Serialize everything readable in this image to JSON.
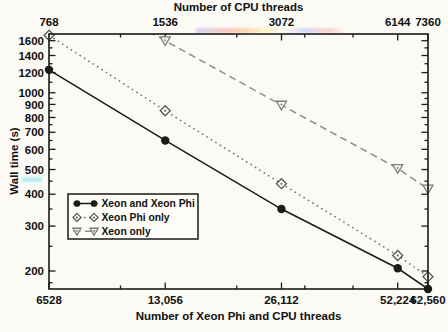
{
  "style": {
    "background": "#fcfaf4",
    "frame_color": "#1a1a1a",
    "text_color": "#111111",
    "legend_bg": "#fdfcf6"
  },
  "chart_data": {
    "type": "line",
    "x2label": "Number of CPU threads",
    "xlabel": "Number of Xeon Phi and CPU threads",
    "ylabel": "Wall time (s)",
    "x_scale": "log",
    "y_scale": "log",
    "grid": false,
    "xlim": [
      6528,
      62560
    ],
    "ylim": [
      170,
      1700
    ],
    "x_ticks": [
      {
        "value": 6528,
        "label": "6528"
      },
      {
        "value": 13056,
        "label": "13,056"
      },
      {
        "value": 26112,
        "label": "26,112"
      },
      {
        "value": 52224,
        "label": "52,224"
      },
      {
        "value": 62560,
        "label": "62,560"
      }
    ],
    "x_minor_ticks": [
      10000,
      20000,
      30000,
      40000
    ],
    "x2_ticks": [
      {
        "value": 6528,
        "label": "768"
      },
      {
        "value": 13056,
        "label": "1536"
      },
      {
        "value": 26112,
        "label": "3072"
      },
      {
        "value": 52224,
        "label": "6144"
      },
      {
        "value": 62560,
        "label": "7360"
      }
    ],
    "y_ticks": [
      {
        "value": 1600,
        "label": "1600"
      },
      {
        "value": 1400,
        "label": "1400"
      },
      {
        "value": 1200,
        "label": "1200"
      },
      {
        "value": 1000,
        "label": "1000"
      },
      {
        "value": 900,
        "label": "900"
      },
      {
        "value": 800,
        "label": "800"
      },
      {
        "value": 700,
        "label": "700"
      },
      {
        "value": 600,
        "label": "600"
      },
      {
        "value": 500,
        "label": "500"
      },
      {
        "value": 400,
        "label": "400"
      },
      {
        "value": 300,
        "label": "300"
      },
      {
        "value": 200,
        "label": "200"
      }
    ],
    "y_minor_ticks": [
      180,
      250,
      350,
      450,
      550,
      650,
      750,
      850,
      950,
      1100,
      1300,
      1500
    ],
    "series": [
      {
        "name": "Xeon and Xeon Phi",
        "line_style": "solid",
        "marker": "filled-circle",
        "color": "#1b1b1b",
        "marker_color": "#1b1b1b",
        "x": [
          6528,
          13056,
          26112,
          52224,
          62560
        ],
        "y": [
          1230,
          650,
          350,
          205,
          170
        ]
      },
      {
        "name": "Xeon Phi only",
        "line_style": "dotted",
        "marker": "open-diamond",
        "color": "#6f6f66",
        "marker_color": "#57574f",
        "x": [
          6528,
          13056,
          26112,
          52224,
          62560
        ],
        "y": [
          1680,
          850,
          440,
          230,
          190
        ]
      },
      {
        "name": "Xeon only",
        "line_style": "dashed",
        "marker": "open-triangle-down",
        "color": "#8f8f88",
        "marker_color": "#7d7d76",
        "x": [
          6528,
          13056,
          26112,
          52224,
          62560
        ],
        "y": [
          2900,
          1600,
          895,
          505,
          420
        ]
      }
    ],
    "legend": {
      "position": "center-left",
      "entries": [
        "Xeon and Xeon Phi",
        "Xeon Phi only",
        "Xeon only"
      ]
    }
  }
}
